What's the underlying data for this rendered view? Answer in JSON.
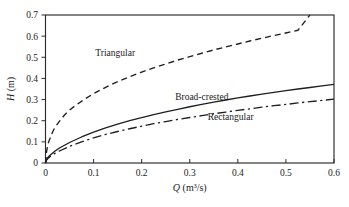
{
  "chart_data": {
    "type": "line",
    "title": "",
    "subtitle": "",
    "xlabel_parts": {
      "variable": "Q",
      "units": " (m³/s)"
    },
    "ylabel_parts": {
      "variable": "H",
      "units": " (m)"
    },
    "xlabel": "Q (m³/s)",
    "ylabel": "H (m)",
    "xlim": [
      0,
      0.6
    ],
    "ylim": [
      0,
      0.7
    ],
    "xticks": [
      0,
      0.1,
      0.2,
      0.3,
      0.4,
      0.5,
      0.6
    ],
    "xtick_labels": [
      "0",
      "0.1",
      "0.2",
      "0.3",
      "0.4",
      "0.5",
      "0.6"
    ],
    "yticks": [
      0,
      0.1,
      0.2,
      0.3,
      0.4,
      0.5,
      0.6,
      0.7
    ],
    "ytick_labels": [
      "0",
      "0.1",
      "0.2",
      "0.3",
      "0.4",
      "0.5",
      "0.6",
      "0.7"
    ],
    "grid": false,
    "legend_position": "inline-annotations",
    "tick_direction": {
      "x": "in",
      "y": "out"
    },
    "frame": "box",
    "series": [
      {
        "name": "Triangular",
        "style": "dashed",
        "color": "#1f1f1f",
        "label_position": {
          "x": 0.145,
          "y": 0.505
        },
        "x": [
          0.0,
          0.002,
          0.005,
          0.01,
          0.015,
          0.02,
          0.03,
          0.04,
          0.05,
          0.06,
          0.08,
          0.1,
          0.125,
          0.15,
          0.175,
          0.2,
          0.225,
          0.25,
          0.275,
          0.3,
          0.325,
          0.35,
          0.375,
          0.4,
          0.425,
          0.45,
          0.475,
          0.5,
          0.525,
          0.55
        ],
        "y": [
          0.0,
          0.05,
          0.09,
          0.12,
          0.148,
          0.17,
          0.2,
          0.228,
          0.25,
          0.268,
          0.3,
          0.328,
          0.358,
          0.385,
          0.408,
          0.43,
          0.45,
          0.468,
          0.487,
          0.503,
          0.519,
          0.535,
          0.549,
          0.563,
          0.577,
          0.59,
          0.603,
          0.615,
          0.628,
          0.7
        ]
      },
      {
        "name": "Broad-crested",
        "style": "solid",
        "color": "#1f1f1f",
        "label_position": {
          "x": 0.325,
          "y": 0.3
        },
        "x": [
          0.0,
          0.002,
          0.005,
          0.01,
          0.02,
          0.03,
          0.05,
          0.075,
          0.1,
          0.125,
          0.15,
          0.175,
          0.2,
          0.225,
          0.25,
          0.275,
          0.3,
          0.325,
          0.35,
          0.375,
          0.4,
          0.425,
          0.45,
          0.475,
          0.5,
          0.525,
          0.55,
          0.575,
          0.6
        ],
        "y": [
          0.0,
          0.016,
          0.026,
          0.038,
          0.057,
          0.072,
          0.097,
          0.123,
          0.146,
          0.166,
          0.184,
          0.2,
          0.215,
          0.229,
          0.242,
          0.254,
          0.266,
          0.277,
          0.288,
          0.298,
          0.308,
          0.317,
          0.326,
          0.334,
          0.342,
          0.35,
          0.357,
          0.365,
          0.372
        ]
      },
      {
        "name": "Rectangular",
        "style": "dash-dot",
        "color": "#1f1f1f",
        "label_position": {
          "x": 0.385,
          "y": 0.205
        },
        "x": [
          0.0,
          0.002,
          0.005,
          0.01,
          0.02,
          0.03,
          0.05,
          0.075,
          0.1,
          0.125,
          0.15,
          0.175,
          0.2,
          0.225,
          0.25,
          0.275,
          0.3,
          0.325,
          0.35,
          0.375,
          0.4,
          0.425,
          0.45,
          0.475,
          0.5,
          0.525,
          0.55,
          0.575,
          0.6
        ],
        "y": [
          0.0,
          0.013,
          0.021,
          0.031,
          0.046,
          0.058,
          0.079,
          0.1,
          0.119,
          0.135,
          0.149,
          0.162,
          0.174,
          0.186,
          0.196,
          0.206,
          0.215,
          0.224,
          0.233,
          0.241,
          0.249,
          0.256,
          0.264,
          0.271,
          0.277,
          0.284,
          0.29,
          0.296,
          0.302
        ]
      }
    ]
  }
}
